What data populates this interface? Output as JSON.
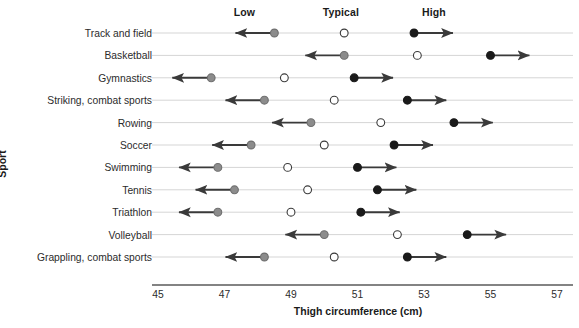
{
  "chart_data": {
    "type": "scatter",
    "title": "",
    "xlabel": "Thigh circumference (cm)",
    "ylabel": "Sport",
    "xlim": [
      45,
      57
    ],
    "xticks": [
      45,
      47,
      49,
      51,
      53,
      55,
      57
    ],
    "xtick_labels": [
      "45",
      "47",
      "49",
      "51",
      "53",
      "55",
      "57"
    ],
    "grid": true,
    "legend_position": "top",
    "column_headers": [
      {
        "label": "Low",
        "x": 47.6
      },
      {
        "label": "Typical",
        "x": 50.5
      },
      {
        "label": "High",
        "x": 53.3
      }
    ],
    "series": [
      {
        "name": "Low",
        "marker": "filled-circle",
        "color": "#8c8c8c",
        "arrow": "left"
      },
      {
        "name": "Typical",
        "marker": "open-circle",
        "color": "#ffffff",
        "arrow": "none"
      },
      {
        "name": "High",
        "marker": "filled-circle",
        "color": "#1a1a1a",
        "arrow": "right"
      }
    ],
    "categories": [
      "Track and field",
      "Basketball",
      "Gymnastics",
      "Striking, combat sports",
      "Rowing",
      "Soccer",
      "Swimming",
      "Tennis",
      "Triathlon",
      "Volleyball",
      "Grappling, combat sports"
    ],
    "rows": [
      {
        "sport": "Track and field",
        "low": 48.5,
        "typical": 50.6,
        "high": 52.7
      },
      {
        "sport": "Basketball",
        "low": 50.6,
        "typical": 52.8,
        "high": 55.0
      },
      {
        "sport": "Gymnastics",
        "low": 46.6,
        "typical": 48.8,
        "high": 50.9
      },
      {
        "sport": "Striking, combat sports",
        "low": 48.2,
        "typical": 50.3,
        "high": 52.5
      },
      {
        "sport": "Rowing",
        "low": 49.6,
        "typical": 51.7,
        "high": 53.9
      },
      {
        "sport": "Soccer",
        "low": 47.8,
        "typical": 50.0,
        "high": 52.1
      },
      {
        "sport": "Swimming",
        "low": 46.8,
        "typical": 48.9,
        "high": 51.0
      },
      {
        "sport": "Tennis",
        "low": 47.3,
        "typical": 49.5,
        "high": 51.6
      },
      {
        "sport": "Triathlon",
        "low": 46.8,
        "typical": 49.0,
        "high": 51.1
      },
      {
        "sport": "Volleyball",
        "low": 50.0,
        "typical": 52.2,
        "high": 54.3
      },
      {
        "sport": "Grappling, combat sports",
        "low": 48.2,
        "typical": 50.3,
        "high": 52.5
      }
    ],
    "arrow_span": 1.17,
    "colors": {
      "low_marker": "#8c8c8c",
      "typical_marker_fill": "#ffffff",
      "typical_marker_stroke": "#3a3a3a",
      "high_marker": "#1a1a1a",
      "arrow": "#3a3a3a",
      "gridline": "#d5d5d5",
      "axis": "#5a5a5a",
      "text": "#2b2b2b"
    }
  }
}
